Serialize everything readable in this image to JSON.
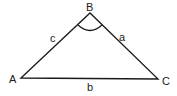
{
  "diagram": {
    "type": "triangle",
    "vertices": [
      {
        "label": "A",
        "x": 21,
        "y": 78
      },
      {
        "label": "B",
        "x": 90,
        "y": 13
      },
      {
        "label": "C",
        "x": 158,
        "y": 79
      }
    ],
    "sides": [
      {
        "label": "a",
        "between": "B-C"
      },
      {
        "label": "b",
        "between": "A-C"
      },
      {
        "label": "c",
        "between": "A-B"
      }
    ],
    "angle_marked": "B",
    "stroke_color": "#1a1a1a"
  }
}
